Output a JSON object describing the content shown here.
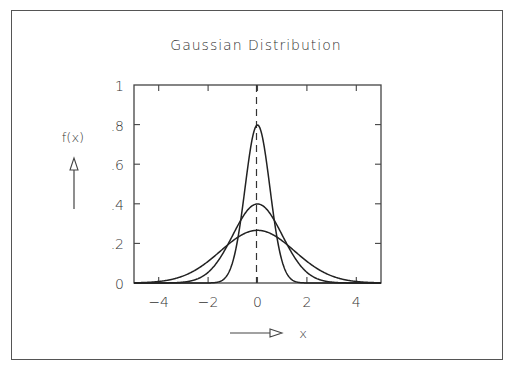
{
  "chart_data": {
    "type": "line",
    "title": "Gaussian Distribution",
    "xlabel": "x",
    "ylabel": "f(x)",
    "xlim": [
      -5,
      5
    ],
    "ylim": [
      0,
      1
    ],
    "x_ticks": [
      -4,
      -2,
      0,
      2,
      4
    ],
    "x_tick_labels": [
      "−4",
      "−2",
      "0",
      "2",
      "4"
    ],
    "y_ticks": [
      0,
      0.2,
      0.4,
      0.6,
      0.8,
      1
    ],
    "y_tick_labels": [
      "0",
      ".2",
      ".4",
      ".6",
      ".8",
      "1"
    ],
    "grid": false,
    "legend": null,
    "annotations": [
      {
        "type": "vertical-dashed-line",
        "x": 0
      },
      {
        "type": "arrow-up",
        "label": "f(x)"
      },
      {
        "type": "arrow-right",
        "label": "x"
      }
    ],
    "series": [
      {
        "name": "Gaussian mean 0, sigma 0.5",
        "mean": 0,
        "sigma": 0.5,
        "peak": 0.798
      },
      {
        "name": "Gaussian mean 0, sigma 1",
        "mean": 0,
        "sigma": 1.0,
        "peak": 0.399
      },
      {
        "name": "Gaussian mean 0, sigma 1.5",
        "mean": 0,
        "sigma": 1.5,
        "peak": 0.266
      }
    ],
    "colors": {
      "line": "#222222",
      "axis": "#444444",
      "frame": "#555555"
    }
  }
}
